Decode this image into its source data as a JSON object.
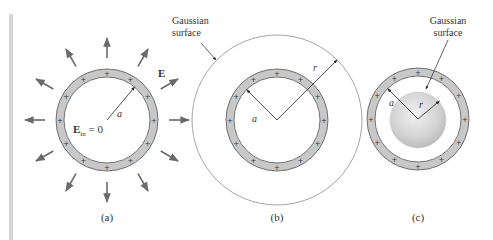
{
  "colors": {
    "shell_fill": "#c8c8c8",
    "shell_stroke": "#555555",
    "arrow": "#6a6a6a",
    "gaussian_line": "#9a9a9a",
    "text": "#333333",
    "sidebar": "#d6d6d6"
  },
  "panels": [
    {
      "id": "a",
      "caption": "(a)",
      "center": [
        107,
        120
      ],
      "shell_outer_r": 51,
      "shell_inner_r": 43,
      "field_label": "E",
      "inside_field_label_main": "E",
      "inside_field_label_sub": "in",
      "inside_field_label_rest": " = 0",
      "radius_label": "a",
      "field_arrow_count": 12
    },
    {
      "id": "b",
      "caption": "(b)",
      "center": [
        277,
        120
      ],
      "shell_outer_r": 51,
      "shell_inner_r": 43,
      "gaussian_r": 85,
      "gaussian_label_line1": "Gaussian",
      "gaussian_label_line2": "surface",
      "radius_inner_label": "a",
      "radius_outer_label": "r"
    },
    {
      "id": "c",
      "caption": "(c)",
      "center": [
        418,
        119
      ],
      "shell_outer_r": 51,
      "shell_inner_r": 43,
      "gaussian_r": 28,
      "gaussian_label_line1": "Gaussian",
      "gaussian_label_line2": "surface",
      "radius_inner_label": "a",
      "radius_outer_label": "r"
    }
  ],
  "charge_symbol": "+"
}
